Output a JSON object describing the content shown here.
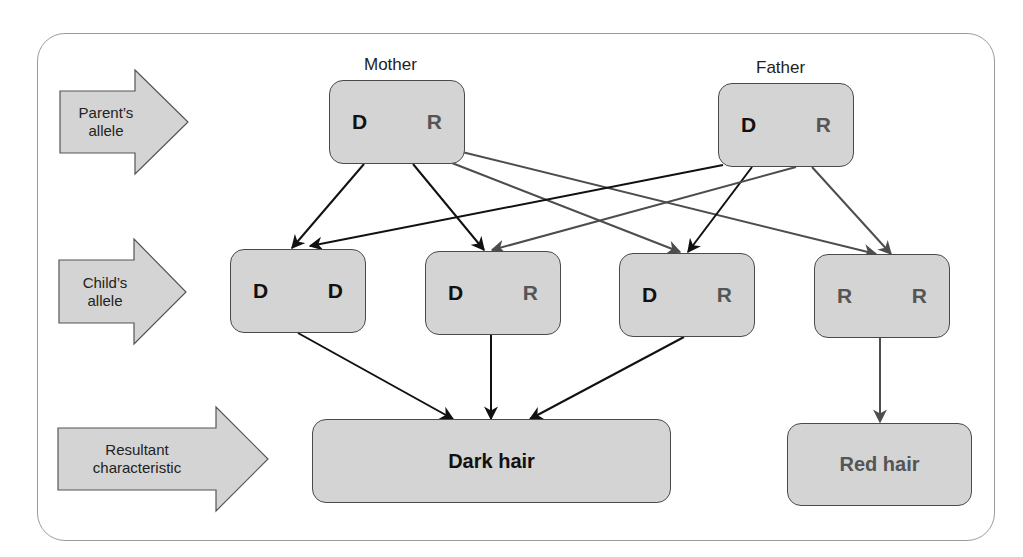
{
  "diagram": {
    "row_labels": {
      "parent": [
        "Parent’s",
        "allele"
      ],
      "child": [
        "Child’s",
        "allele"
      ],
      "result": [
        "Resultant",
        "characteristic"
      ]
    },
    "parents": [
      {
        "label": "Mother",
        "alleles": [
          "D",
          "R"
        ]
      },
      {
        "label": "Father",
        "alleles": [
          "D",
          "R"
        ]
      }
    ],
    "children": [
      {
        "alleles": [
          "D",
          "D"
        ]
      },
      {
        "alleles": [
          "D",
          "R"
        ]
      },
      {
        "alleles": [
          "D",
          "R"
        ]
      },
      {
        "alleles": [
          "R",
          "R"
        ]
      }
    ],
    "results": [
      {
        "label": "Dark hair"
      },
      {
        "label": "Red hair"
      }
    ],
    "colors": {
      "box_fill": "#d4d4d4",
      "box_border": "#4a4a4a",
      "dominant_text": "#111111",
      "recessive_text": "#555555",
      "dominant_arrow": "#111111",
      "recessive_arrow": "#4d4d4d",
      "frame_border": "#9a9a9a"
    }
  }
}
